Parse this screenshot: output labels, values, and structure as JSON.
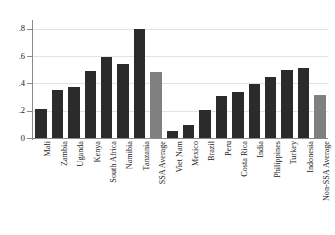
{
  "chart_data": {
    "type": "bar",
    "title": "",
    "subtitle": "",
    "xlabel": "",
    "ylabel": "",
    "ylim": [
      0,
      0.85
    ],
    "yticks": [
      0,
      0.2,
      0.4,
      0.6,
      0.8
    ],
    "ytick_labels": [
      "0",
      ".2",
      ".4",
      ".6",
      ".8"
    ],
    "grid": true,
    "grid_axis": "y",
    "legend": "none",
    "categories": [
      "Mali",
      "Zambia",
      "Uganda",
      "Kenya",
      "South Africa",
      "Namibia",
      "Tanzania",
      "SSA Average",
      "Viet Nam",
      "Mexico",
      "Brazil",
      "Peru",
      "Costa Rica",
      "India",
      "Philippines",
      "Turkey",
      "Indonesia",
      "Non-SSA Average"
    ],
    "values": [
      0.215,
      0.352,
      0.374,
      0.494,
      0.593,
      0.543,
      0.802,
      0.483,
      0.053,
      0.096,
      0.203,
      0.305,
      0.334,
      0.394,
      0.445,
      0.502,
      0.515,
      0.315
    ],
    "bar_colors": [
      "#2b2b2b",
      "#2b2b2b",
      "#2b2b2b",
      "#2b2b2b",
      "#2b2b2b",
      "#2b2b2b",
      "#2b2b2b",
      "#808080",
      "#2b2b2b",
      "#2b2b2b",
      "#2b2b2b",
      "#2b2b2b",
      "#2b2b2b",
      "#2b2b2b",
      "#2b2b2b",
      "#2b2b2b",
      "#2b2b2b",
      "#808080"
    ]
  },
  "colors": {
    "bar_dark": "#2b2b2b",
    "bar_gray": "#808080",
    "axis": "#8a8a8a",
    "gridline": "#e2e2e2",
    "background": "#ffffff",
    "text": "#1a1a1a"
  }
}
